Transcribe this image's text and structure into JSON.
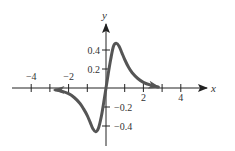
{
  "chart_data": {
    "type": "line",
    "title": "",
    "xlabel": "x",
    "ylabel": "y",
    "xlim": [
      -5,
      5.4
    ],
    "ylim": [
      -0.6,
      0.7
    ],
    "x_ticks": [
      -4,
      -3,
      -2,
      -1,
      0,
      1,
      2,
      3,
      4
    ],
    "x_tick_labels": [
      "−4",
      "−2",
      "2",
      "4"
    ],
    "x_tick_label_values": [
      -4,
      -2,
      2,
      4
    ],
    "y_ticks": [
      -0.4,
      -0.2,
      0.2,
      0.4
    ],
    "y_tick_labels": [
      "−0.4",
      "−0.2",
      "0.2",
      "0.4"
    ],
    "grid": false,
    "legend": null,
    "series": [
      {
        "name": "f(x)",
        "color": "#555555",
        "x": [
          -2.7,
          -2.4,
          -2.0,
          -1.7,
          -1.4,
          -1.2,
          -1.0,
          -0.85,
          -0.7,
          -0.55,
          -0.4,
          -0.25,
          -0.12,
          0,
          0.12,
          0.25,
          0.4,
          0.55,
          0.7,
          0.85,
          1.0,
          1.2,
          1.4,
          1.7,
          2.0,
          2.4,
          2.8
        ],
        "y": [
          -0.02,
          -0.03,
          -0.06,
          -0.1,
          -0.16,
          -0.22,
          -0.29,
          -0.36,
          -0.43,
          -0.46,
          -0.42,
          -0.3,
          -0.15,
          0,
          0.15,
          0.3,
          0.44,
          0.47,
          0.44,
          0.37,
          0.3,
          0.22,
          0.16,
          0.1,
          0.06,
          0.03,
          0.01
        ],
        "arrows": [
          "left-end",
          "right-end"
        ]
      }
    ]
  }
}
